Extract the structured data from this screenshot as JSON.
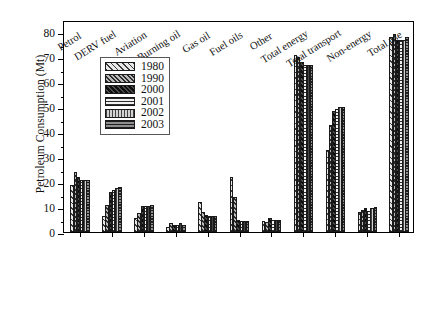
{
  "chart_data": {
    "type": "bar",
    "title": "",
    "subtitle": "",
    "xlabel": "",
    "ylabel": "Petroleum Consumption (Mt)",
    "ylim": [
      0,
      85
    ],
    "ytick_values": [
      0,
      10,
      20,
      30,
      40,
      50,
      60,
      70,
      80
    ],
    "ytick_labels": [
      "0",
      "10",
      "20",
      "30",
      "40",
      "50",
      "60",
      "70",
      "80"
    ],
    "grid": false,
    "legend_position": "upper-left-inside",
    "categories": [
      "Petrol",
      "DERV fuel",
      "Aviation",
      "Burning oil",
      "Gas oil",
      "Fuel oils",
      "Other",
      "Total energy",
      "Total transport",
      "Non-energy",
      "Total use"
    ],
    "series": [
      {
        "name": "1980",
        "pattern": "diagonal-hatch-light",
        "values": [
          19.0,
          6.5,
          5.5,
          2.0,
          12.0,
          22.0,
          4.5,
          71.0,
          33.0,
          8.0,
          78.0
        ]
      },
      {
        "name": "1990",
        "pattern": "diagonal-hatch-medium",
        "values": [
          24.0,
          11.0,
          7.5,
          3.5,
          8.0,
          14.0,
          4.0,
          70.0,
          43.0,
          9.0,
          79.5
        ]
      },
      {
        "name": "2000",
        "pattern": "dense-dark",
        "values": [
          22.0,
          16.0,
          10.5,
          3.0,
          7.0,
          5.0,
          5.5,
          68.0,
          48.5,
          9.5,
          77.0
        ]
      },
      {
        "name": "2001",
        "pattern": "horizontal-lines",
        "values": [
          21.0,
          17.0,
          10.5,
          3.0,
          6.5,
          4.5,
          5.0,
          67.0,
          49.5,
          8.5,
          77.0
        ]
      },
      {
        "name": "2002",
        "pattern": "vertical-lines",
        "values": [
          21.0,
          17.5,
          10.5,
          3.5,
          6.5,
          4.5,
          5.0,
          67.0,
          50.0,
          9.5,
          77.0
        ]
      },
      {
        "name": "2003",
        "pattern": "horizontal-lines-dark",
        "values": [
          21.0,
          18.0,
          11.0,
          3.0,
          6.5,
          4.5,
          5.0,
          67.0,
          50.0,
          10.0,
          78.0
        ]
      }
    ]
  },
  "legend": {
    "entries": [
      "1980",
      "1990",
      "2000",
      "2001",
      "2002",
      "2003"
    ]
  },
  "colors": {
    "axis": "#000000",
    "bar_edge": "#1a1a1a",
    "background": "#ffffff"
  }
}
